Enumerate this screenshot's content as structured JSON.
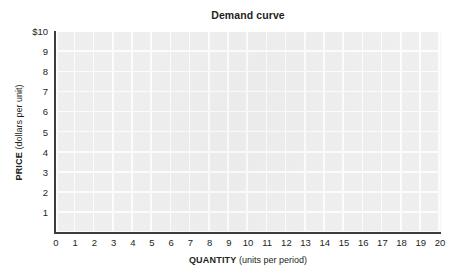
{
  "chart_data": {
    "type": "line",
    "title": "Demand curve",
    "xlabel_key": "QUANTITY",
    "xlabel_unit": "(units per period)",
    "ylabel_key": "PRICE",
    "ylabel_unit": "(dollars per unit)",
    "xlim": [
      0,
      20
    ],
    "ylim": [
      0,
      10
    ],
    "x_ticks": [
      "0",
      "1",
      "2",
      "3",
      "4",
      "5",
      "6",
      "7",
      "8",
      "9",
      "10",
      "11",
      "12",
      "13",
      "14",
      "15",
      "16",
      "17",
      "18",
      "19",
      "20"
    ],
    "x_tick_values": [
      0,
      1,
      2,
      3,
      4,
      5,
      6,
      7,
      8,
      9,
      10,
      11,
      12,
      13,
      14,
      15,
      16,
      17,
      18,
      19,
      20
    ],
    "y_ticks": [
      "$10",
      "9",
      "8",
      "7",
      "6",
      "5",
      "4",
      "3",
      "2",
      "1"
    ],
    "y_tick_values": [
      10,
      9,
      8,
      7,
      6,
      5,
      4,
      3,
      2,
      1
    ],
    "origin_label": "0",
    "grid": true,
    "grid_color": "#ffffff",
    "plot_background": "#f1f1f1",
    "axis_color": "#3d3d3d",
    "legend": null,
    "series": [],
    "annotations": [],
    "note": "Empty grid worksheet; no data series plotted."
  },
  "colors": {
    "page_background": "#ffffff",
    "text": "#231f20",
    "axis": "#3d3d3d",
    "gridline": "#ffffff",
    "plot_fill": "#f1f1f1"
  }
}
